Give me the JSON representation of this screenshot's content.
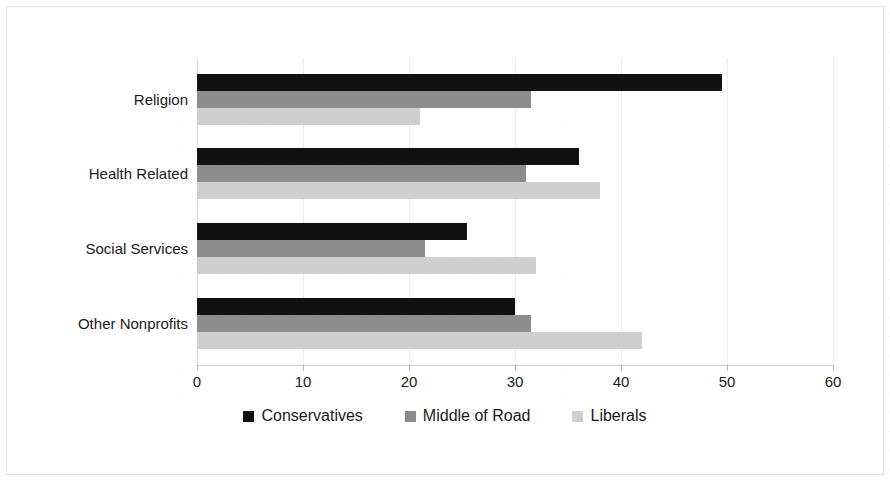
{
  "chart_data": {
    "type": "bar",
    "orientation": "horizontal",
    "title": "",
    "subtitle": "",
    "xlabel": "",
    "ylabel": "",
    "categories": [
      "Religion",
      "Health Related",
      "Social Services",
      "Other Nonprofits"
    ],
    "series": [
      {
        "name": "Conservatives",
        "color": "#111111",
        "values": [
          49.5,
          36.0,
          25.5,
          30.0
        ]
      },
      {
        "name": "Middle of Road",
        "color": "#8d8d8d",
        "values": [
          31.5,
          31.0,
          21.5,
          31.5
        ]
      },
      {
        "name": "Liberals",
        "color": "#cfcfcf",
        "values": [
          21.0,
          38.0,
          32.0,
          42.0
        ]
      }
    ],
    "xlim": [
      0,
      60
    ],
    "xticks": [
      0,
      10,
      20,
      30,
      40,
      50,
      60
    ],
    "xtick_labels": [
      "0",
      "10",
      "20",
      "30",
      "40",
      "50",
      "60"
    ],
    "grid": true,
    "grid_axis": "x",
    "legend_position": "bottom"
  },
  "legend": {
    "items": [
      {
        "label": "Conservatives",
        "swatch_color": "#111111",
        "icon": "square-swatch-icon"
      },
      {
        "label": "Middle of Road",
        "swatch_color": "#8d8d8d",
        "icon": "square-swatch-icon"
      },
      {
        "label": "Liberals",
        "swatch_color": "#cfcfcf",
        "icon": "square-swatch-icon"
      }
    ]
  },
  "colors": {
    "conservatives": "#111111",
    "middle_of_road": "#8d8d8d",
    "liberals": "#cfcfcf",
    "gridline": "#ededed",
    "axis": "#cfcfcf",
    "text": "#1a1a1a",
    "background": "#ffffff"
  }
}
